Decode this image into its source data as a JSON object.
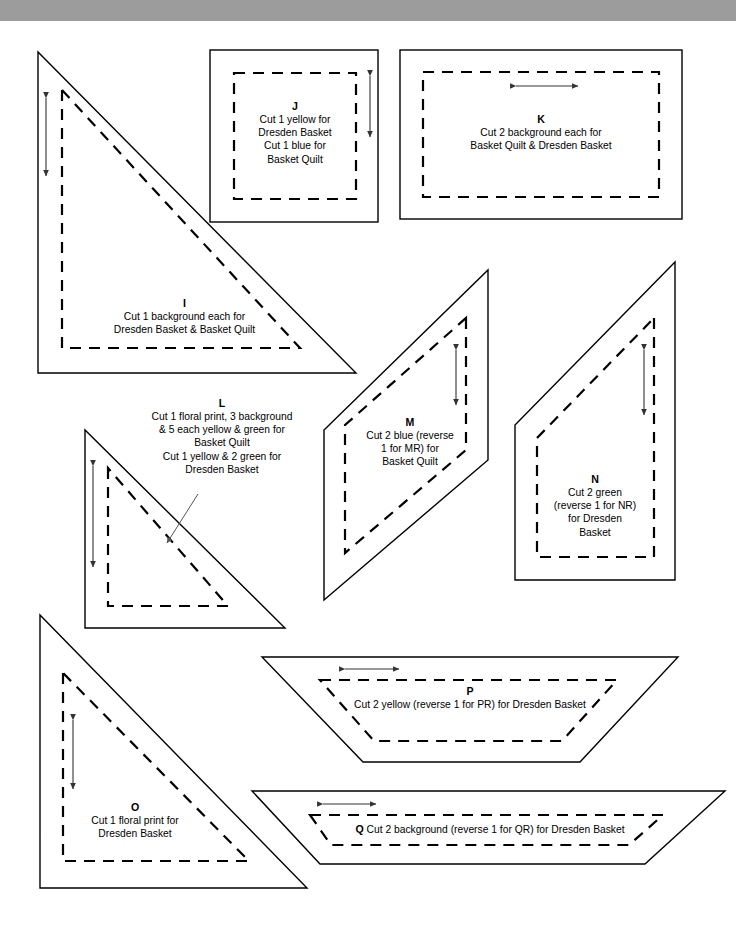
{
  "page": {
    "band_color": "#9c9c9c",
    "paper_color": "#ffffff",
    "ink_color": "#000000"
  },
  "pieces": [
    {
      "id": "I",
      "label": "I",
      "shape": "right-triangle",
      "lines": [
        "Cut 1 background each for",
        "Dresden Basket & Basket Quilt"
      ],
      "grain_arrow": "vertical"
    },
    {
      "id": "J",
      "label": "J",
      "shape": "square",
      "lines": [
        "Cut 1 yellow for",
        "Dresden Basket",
        "Cut 1 blue for",
        "Basket Quilt"
      ],
      "grain_arrow": "vertical"
    },
    {
      "id": "K",
      "label": "K",
      "shape": "rectangle",
      "lines": [
        "Cut 2 background each for",
        "Basket Quilt & Dresden Basket"
      ],
      "grain_arrow": "horizontal"
    },
    {
      "id": "L",
      "label": "L",
      "shape": "right-triangle",
      "lines": [
        "Cut 1 floral print, 3 background",
        "& 5 each yellow & green for",
        "Basket Quilt",
        "Cut 1 yellow & 2 green for",
        "Dresden Basket"
      ],
      "grain_arrow": "vertical"
    },
    {
      "id": "M",
      "label": "M",
      "shape": "parallelogram",
      "lines": [
        "Cut 2 blue (reverse",
        "1 for MR) for",
        "Basket Quilt"
      ],
      "grain_arrow": "vertical"
    },
    {
      "id": "N",
      "label": "N",
      "shape": "quadrilateral",
      "lines": [
        "Cut 2 green",
        "(reverse 1 for NR)",
        "for Dresden",
        "Basket"
      ],
      "grain_arrow": "vertical"
    },
    {
      "id": "O",
      "label": "O",
      "shape": "right-triangle",
      "lines": [
        "Cut 1 floral print for",
        "Dresden Basket"
      ],
      "grain_arrow": "vertical"
    },
    {
      "id": "P",
      "label": "P",
      "shape": "trapezoid",
      "lines": [
        "Cut 2 yellow (reverse 1 for PR) for Dresden Basket"
      ],
      "grain_arrow": "horizontal"
    },
    {
      "id": "Q",
      "label": "Q",
      "shape": "trapezoid",
      "lines": [
        "Cut 2 background (reverse 1 for QR) for Dresden Basket"
      ],
      "grain_arrow": "horizontal"
    }
  ]
}
